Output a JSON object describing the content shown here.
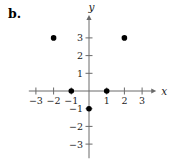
{
  "figure_label": "b.",
  "chart_data": {
    "type": "scatter",
    "title": "",
    "xlabel": "x",
    "ylabel": "y",
    "grid": false,
    "legend": null,
    "xlim": [
      -3.4,
      3.8
    ],
    "ylim": [
      -3.8,
      4.3
    ],
    "points": [
      {
        "x": -2,
        "y": 3
      },
      {
        "x": 2,
        "y": 3
      },
      {
        "x": -1,
        "y": 0
      },
      {
        "x": 1,
        "y": 0
      },
      {
        "x": 0,
        "y": -1
      }
    ],
    "x_ticks": [
      {
        "value": -3,
        "label": "−3"
      },
      {
        "value": -2,
        "label": "−2"
      },
      {
        "value": -1,
        "label": "−1"
      },
      {
        "value": 1,
        "label": "1"
      },
      {
        "value": 2,
        "label": "2"
      },
      {
        "value": 3,
        "label": "3"
      }
    ],
    "y_ticks": [
      {
        "value": -3,
        "label": "−3"
      },
      {
        "value": -2,
        "label": "−2"
      },
      {
        "value": -1,
        "label": "−1"
      },
      {
        "value": 1,
        "label": "1"
      },
      {
        "value": 2,
        "label": "2"
      },
      {
        "value": 3,
        "label": "3"
      }
    ],
    "colors": {
      "axis": "#6a6a6a",
      "point": "#000000",
      "text": "#1c1c1c"
    }
  }
}
